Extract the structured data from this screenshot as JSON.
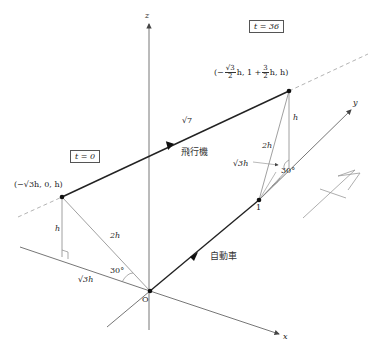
{
  "diagram": {
    "type": "3d-coordinate-geometry",
    "axes": {
      "x_label": "x",
      "y_label": "y",
      "z_label": "z",
      "origin_label": "O"
    },
    "time_labels": {
      "start": "t = 0",
      "end": "t = 36"
    },
    "points": {
      "airplane_start": "(−√3h, 0, h)",
      "airplane_end_prefix": "(−",
      "airplane_end_frac1_num": "√3",
      "airplane_end_frac1_den": "2",
      "airplane_end_mid": "h, 1 +",
      "airplane_end_frac2_num": "3",
      "airplane_end_frac2_den": "2",
      "airplane_end_suffix": "h, h)",
      "car_point": "1"
    },
    "objects": {
      "airplane": "飛行機",
      "car": "自動車"
    },
    "lengths": {
      "airplane_speed": "√7",
      "height_left": "h",
      "hyp_left": "2h",
      "base_left": "√3h",
      "height_right": "h",
      "hyp_right": "2h",
      "base_right": "√3h"
    },
    "angles": {
      "left": "30°",
      "right": "30°"
    },
    "colors": {
      "line": "#333333",
      "axis": "#666666",
      "thin": "#888888",
      "dashed": "#aaaaaa"
    }
  }
}
